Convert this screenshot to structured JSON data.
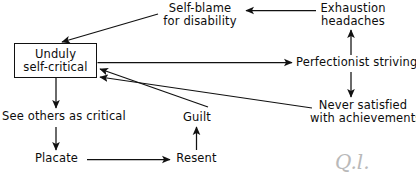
{
  "diagram": {
    "type": "flow-diagram",
    "background_color": "#ffffff",
    "line_color": "#111111",
    "text_color": "#0d0d0d",
    "nodes": [
      {
        "id": "unduly-self-critical",
        "label": "Unduly\nself-critical",
        "shape": "box",
        "x": 14,
        "y": 43,
        "w": 83,
        "h": 35
      },
      {
        "id": "self-blame-for-disability",
        "label": "Self-blame\nfor disability",
        "shape": "text",
        "x": 161,
        "y": 2,
        "w": 78,
        "h": 26
      },
      {
        "id": "exhaustion-headaches",
        "label": "Exhaustion\nheadaches",
        "shape": "text",
        "x": 317,
        "y": 2,
        "w": 72,
        "h": 26
      },
      {
        "id": "perfectionist-striving",
        "label": "Perfectionist striving",
        "shape": "text",
        "x": 296,
        "y": 56,
        "w": 120,
        "h": 14
      },
      {
        "id": "never-satisfied-with-achievements",
        "label": "Never satisfied\nwith achievements",
        "shape": "text",
        "x": 310,
        "y": 99,
        "w": 104,
        "h": 26
      },
      {
        "id": "see-others-as-critical",
        "label": "See others as critical",
        "shape": "text",
        "x": 2,
        "y": 110,
        "w": 122,
        "h": 14
      },
      {
        "id": "guilt",
        "label": "Guilt",
        "shape": "text",
        "x": 183,
        "y": 111,
        "w": 32,
        "h": 14
      },
      {
        "id": "placate",
        "label": "Placate",
        "shape": "text",
        "x": 35,
        "y": 152,
        "w": 45,
        "h": 14
      },
      {
        "id": "resent",
        "label": "Resent",
        "shape": "text",
        "x": 174,
        "y": 152,
        "w": 45,
        "h": 14
      }
    ],
    "edges": [
      {
        "id": "edge-self-blame-to-unduly",
        "from": "self-blame-for-disability",
        "to": "unduly-self-critical",
        "style": "diagonal-arrow"
      },
      {
        "id": "edge-exhaustion-to-self-blame",
        "from": "exhaustion-headaches",
        "to": "self-blame-for-disability",
        "style": "horizontal-arrow-left"
      },
      {
        "id": "edge-unduly-to-perfectionist",
        "from": "unduly-self-critical",
        "to": "perfectionist-striving",
        "style": "horizontal-arrow-right"
      },
      {
        "id": "edge-perfectionist-to-exhaustion",
        "from": "perfectionist-striving",
        "to": "exhaustion-headaches",
        "style": "vertical-arrow-up"
      },
      {
        "id": "edge-perfectionist-to-never-satisfied",
        "from": "perfectionist-striving",
        "to": "never-satisfied-with-achievements",
        "style": "vertical-arrow-down"
      },
      {
        "id": "edge-never-satisfied-to-unduly",
        "from": "never-satisfied-with-achievements",
        "to": "unduly-self-critical",
        "style": "diagonal-arrow"
      },
      {
        "id": "edge-guilt-to-unduly",
        "from": "guilt",
        "to": "unduly-self-critical",
        "style": "diagonal-arrow"
      },
      {
        "id": "edge-unduly-to-see-others",
        "from": "unduly-self-critical",
        "to": "see-others-as-critical",
        "style": "vertical-arrow-down"
      },
      {
        "id": "edge-see-others-to-placate",
        "from": "see-others-as-critical",
        "to": "placate",
        "style": "vertical-arrow-down"
      },
      {
        "id": "edge-placate-to-resent",
        "from": "placate",
        "to": "resent",
        "style": "horizontal-arrow-right"
      },
      {
        "id": "edge-resent-to-guilt",
        "from": "resent",
        "to": "guilt",
        "style": "vertical-arrow-up"
      }
    ],
    "annotation": {
      "id": "handwritten-mark",
      "label": "Q.l.",
      "x": 335,
      "y": 152
    }
  }
}
